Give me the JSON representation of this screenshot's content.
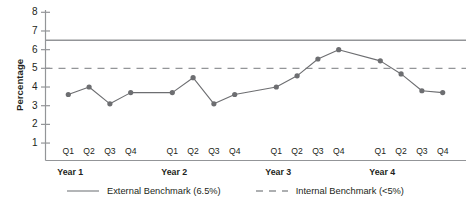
{
  "chart_data": {
    "type": "line",
    "title": "",
    "xlabel": "",
    "ylabel": "Percentage",
    "ylim": [
      0,
      8
    ],
    "yticks": [
      1,
      2,
      3,
      4,
      5,
      6,
      7,
      8
    ],
    "ytick_labels": [
      "1",
      "2",
      "3",
      "4",
      "5",
      "6",
      "7",
      "8"
    ],
    "grid": false,
    "legend_position": "bottom",
    "categories": [
      "Year 1 Q1",
      "Year 1 Q2",
      "Year 1 Q3",
      "Year 1 Q4",
      "Year 2 Q1",
      "Year 2 Q2",
      "Year 2 Q3",
      "Year 2 Q4",
      "Year 3 Q1",
      "Year 3 Q2",
      "Year 3 Q3",
      "Year 3 Q4",
      "Year 4 Q1",
      "Year 4 Q2",
      "Year 4 Q3",
      "Year 4 Q4"
    ],
    "quarter_labels": [
      "Q1",
      "Q2",
      "Q3",
      "Q4",
      "Q1",
      "Q2",
      "Q3",
      "Q4",
      "Q1",
      "Q2",
      "Q3",
      "Q4",
      "Q1",
      "Q2",
      "Q3",
      "Q4"
    ],
    "year_groups": [
      {
        "label": "Year 1",
        "quarters": [
          "Q1",
          "Q2",
          "Q3",
          "Q4"
        ]
      },
      {
        "label": "Year 2",
        "quarters": [
          "Q1",
          "Q2",
          "Q3",
          "Q4"
        ]
      },
      {
        "label": "Year 3",
        "quarters": [
          "Q1",
          "Q2",
          "Q3",
          "Q4"
        ]
      },
      {
        "label": "Year 4",
        "quarters": [
          "Q1",
          "Q2",
          "Q3",
          "Q4"
        ]
      }
    ],
    "series": [
      {
        "name": "Percentage",
        "style": "line-markers",
        "color": "#6d6e71",
        "values": [
          3.6,
          4.0,
          3.1,
          3.7,
          3.7,
          4.5,
          3.1,
          3.6,
          4.0,
          4.6,
          5.5,
          6.0,
          5.4,
          4.7,
          3.8,
          3.7
        ]
      }
    ],
    "reference_lines": [
      {
        "name": "External Benchmark (6.5%)",
        "value": 6.5,
        "style": "solid",
        "color": "#939598"
      },
      {
        "name": "Internal Benchmark (<5%)",
        "value": 5.0,
        "style": "dashed",
        "color": "#939598"
      }
    ],
    "legend": [
      {
        "label": "External Benchmark (6.5%)",
        "style": "solid",
        "color": "#939598"
      },
      {
        "label": "Internal Benchmark (<5%)",
        "style": "dashed",
        "color": "#939598"
      }
    ]
  },
  "axis": {
    "y_title": "Percentage"
  },
  "colors": {
    "series": "#6d6e71",
    "benchmark": "#939598",
    "axis": "#939598",
    "text": "#231f20"
  }
}
